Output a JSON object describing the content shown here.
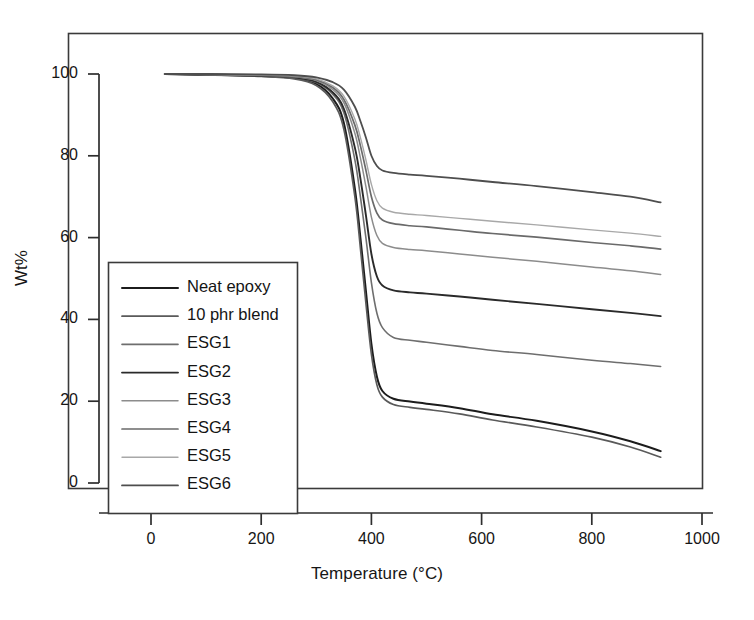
{
  "chart_data": {
    "type": "line",
    "title": "",
    "xlabel": "Temperature (°C)",
    "ylabel": "Wt%",
    "xlim": [
      -120,
      1060
    ],
    "ylim": [
      -12,
      108
    ],
    "xticks": [
      0,
      200,
      400,
      600,
      800,
      1000
    ],
    "yticks": [
      0,
      20,
      40,
      60,
      80,
      100
    ],
    "grid": false,
    "legend_position": "inside-left",
    "x": [
      25,
      100,
      200,
      260,
      300,
      330,
      350,
      370,
      380,
      390,
      400,
      410,
      420,
      440,
      470,
      500,
      560,
      620,
      700,
      800,
      870,
      925
    ],
    "series": [
      {
        "name": "Neat epoxy",
        "color": "#1c1c1c",
        "width": 2.0,
        "values": [
          100,
          99.8,
          99.5,
          99.0,
          97.6,
          94.0,
          88.0,
          72.0,
          60.0,
          47.0,
          34.0,
          26.0,
          22.5,
          20.6,
          19.9,
          19.4,
          18.3,
          16.8,
          15.2,
          12.6,
          10.2,
          7.8
        ]
      },
      {
        "name": "10 phr blend",
        "color": "#5a5a5a",
        "width": 1.7,
        "values": [
          100,
          99.8,
          99.4,
          98.8,
          97.2,
          93.2,
          86.5,
          70.0,
          57.5,
          44.0,
          31.5,
          24.0,
          21.0,
          19.2,
          18.5,
          18.0,
          16.9,
          15.4,
          13.7,
          11.2,
          8.8,
          6.3
        ]
      },
      {
        "name": "ESG1",
        "color": "#6e6e6e",
        "width": 1.6,
        "values": [
          100,
          99.9,
          99.6,
          99.1,
          97.9,
          95.0,
          90.5,
          79.0,
          70.0,
          60.0,
          49.0,
          41.5,
          38.0,
          35.6,
          34.9,
          34.4,
          33.4,
          32.4,
          31.4,
          30.0,
          29.2,
          28.5
        ]
      },
      {
        "name": "ESG2",
        "color": "#2a2a2a",
        "width": 1.9,
        "values": [
          100,
          99.9,
          99.6,
          99.2,
          98.1,
          95.5,
          91.5,
          82.0,
          74.5,
          65.5,
          56.0,
          50.5,
          48.3,
          47.1,
          46.6,
          46.3,
          45.6,
          44.8,
          43.8,
          42.5,
          41.6,
          40.8
        ]
      },
      {
        "name": "ESG3",
        "color": "#8c8c8c",
        "width": 1.5,
        "values": [
          100,
          99.9,
          99.7,
          99.3,
          98.4,
          96.2,
          93.0,
          85.5,
          79.5,
          72.5,
          65.0,
          60.5,
          58.6,
          57.6,
          57.1,
          56.8,
          56.0,
          55.2,
          54.2,
          52.8,
          51.9,
          51.0
        ]
      },
      {
        "name": "ESG4",
        "color": "#6a6a6a",
        "width": 1.7,
        "values": [
          100,
          99.9,
          99.7,
          99.4,
          98.6,
          96.7,
          93.8,
          87.5,
          82.5,
          76.5,
          70.0,
          66.0,
          64.3,
          63.4,
          62.9,
          62.6,
          61.8,
          61.0,
          60.1,
          58.8,
          58.0,
          57.2
        ]
      },
      {
        "name": "ESG5",
        "color": "#a8a8a8",
        "width": 1.4,
        "values": [
          100,
          99.9,
          99.8,
          99.5,
          98.8,
          97.1,
          94.6,
          89.0,
          84.5,
          79.0,
          73.0,
          69.0,
          67.2,
          66.2,
          65.7,
          65.4,
          64.7,
          64.0,
          63.1,
          61.9,
          61.1,
          60.3
        ]
      },
      {
        "name": "ESG6",
        "color": "#4e4e4e",
        "width": 1.8,
        "values": [
          100,
          100,
          99.9,
          99.7,
          99.2,
          98.0,
          96.2,
          92.0,
          88.5,
          84.5,
          80.0,
          77.5,
          76.4,
          75.8,
          75.4,
          75.1,
          74.4,
          73.6,
          72.6,
          71.1,
          70.0,
          68.6
        ]
      }
    ]
  },
  "legend": {
    "items": [
      {
        "label": "Neat epoxy"
      },
      {
        "label": "10 phr blend"
      },
      {
        "label": "ESG1"
      },
      {
        "label": "ESG2"
      },
      {
        "label": "ESG3"
      },
      {
        "label": "ESG4"
      },
      {
        "label": "ESG5"
      },
      {
        "label": "ESG6"
      }
    ]
  },
  "axes": {
    "x_ticks": [
      "0",
      "200",
      "400",
      "600",
      "800",
      "1000"
    ],
    "y_ticks": [
      "0",
      "20",
      "40",
      "60",
      "80",
      "100"
    ],
    "x_title": "Temperature (°C)",
    "y_title": "Wt%"
  },
  "style": {
    "frame_color": "#3a3a3a",
    "background": "#ffffff"
  }
}
